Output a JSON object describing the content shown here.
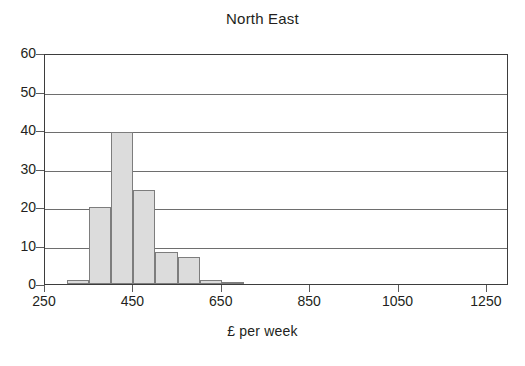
{
  "chart_data": {
    "type": "bar",
    "title": "North East",
    "xlabel": "£ per week",
    "ylabel": "",
    "xlim": [
      250,
      1300
    ],
    "ylim": [
      0,
      60
    ],
    "grid": true,
    "legend": "none",
    "bin_width": 50,
    "x_tick_labels": [
      "250",
      "450",
      "650",
      "850",
      "1050",
      "1250"
    ],
    "x_ticks": [
      250,
      450,
      650,
      850,
      1050,
      1250
    ],
    "y_tick_labels": [
      "0",
      "10",
      "20",
      "30",
      "40",
      "50",
      "60"
    ],
    "y_ticks": [
      0,
      10,
      20,
      30,
      40,
      50,
      60
    ],
    "bins": [
      {
        "start": 300,
        "end": 350,
        "value": 1
      },
      {
        "start": 350,
        "end": 400,
        "value": 20
      },
      {
        "start": 400,
        "end": 450,
        "value": 39.5
      },
      {
        "start": 450,
        "end": 500,
        "value": 24.3
      },
      {
        "start": 500,
        "end": 550,
        "value": 8.3
      },
      {
        "start": 550,
        "end": 600,
        "value": 7
      },
      {
        "start": 600,
        "end": 650,
        "value": 1
      },
      {
        "start": 650,
        "end": 700,
        "value": 0.5
      }
    ],
    "colors": {
      "bar_fill": "#dcdcdc",
      "bar_border": "#7d7d7d",
      "grid": "#6e6e6e",
      "axis": "#3d3d3d",
      "text": "#231f20",
      "background": "#ffffff"
    }
  }
}
